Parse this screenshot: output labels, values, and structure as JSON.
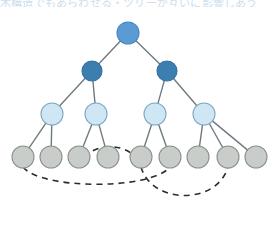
{
  "figure": {
    "background_color": "#ffffff",
    "width": 279,
    "height": 235
  },
  "caption": {
    "text": "木構造でもあらわせる・ツリーが互いに影響しあう",
    "color": "#9fc4e0",
    "clipped": true
  },
  "palette": {
    "root_fill": "#5a9bd4",
    "root_stroke": "#4a86bd",
    "level2_fill": "#3d7eb0",
    "level2_stroke": "#356f9c",
    "level3_fill": "#cfe7f5",
    "level3_stroke": "#7fa8bf",
    "leaf_fill": "#c8cdc9",
    "leaf_stroke": "#8a918d",
    "edge_color": "#6f7a80",
    "dashed_color": "#2b2b2b"
  },
  "chart_data": {
    "type": "diagram",
    "levels": [
      {
        "name": "root",
        "y": 33,
        "radius": 11,
        "count": 1
      },
      {
        "name": "level2",
        "y": 71,
        "radius": 10,
        "count": 2
      },
      {
        "name": "level3",
        "y": 114,
        "radius": 11,
        "count": 4
      },
      {
        "name": "leaf",
        "y": 157,
        "radius": 11,
        "count": 9
      }
    ],
    "nodes": [
      {
        "id": "r",
        "level": "root",
        "x": 128,
        "y": 33,
        "r": 11,
        "fill": "#5a9bd4",
        "stroke": "#4a86bd"
      },
      {
        "id": "a",
        "level": "level2",
        "x": 92,
        "y": 71,
        "r": 10,
        "fill": "#3d7eb0",
        "stroke": "#356f9c"
      },
      {
        "id": "b",
        "level": "level2",
        "x": 167,
        "y": 71,
        "r": 10,
        "fill": "#3d7eb0",
        "stroke": "#356f9c"
      },
      {
        "id": "c1",
        "level": "level3",
        "x": 52,
        "y": 114,
        "r": 11,
        "fill": "#cfe7f5",
        "stroke": "#7fa8bf"
      },
      {
        "id": "c2",
        "level": "level3",
        "x": 96,
        "y": 114,
        "r": 11,
        "fill": "#cfe7f5",
        "stroke": "#7fa8bf"
      },
      {
        "id": "c3",
        "level": "level3",
        "x": 155,
        "y": 114,
        "r": 11,
        "fill": "#cfe7f5",
        "stroke": "#7fa8bf"
      },
      {
        "id": "c4",
        "level": "level3",
        "x": 204,
        "y": 114,
        "r": 11,
        "fill": "#cfe7f5",
        "stroke": "#7fa8bf"
      },
      {
        "id": "l1",
        "level": "leaf",
        "x": 23,
        "y": 157,
        "r": 11,
        "fill": "#c8cdc9",
        "stroke": "#8a918d"
      },
      {
        "id": "l2",
        "level": "leaf",
        "x": 51,
        "y": 157,
        "r": 11,
        "fill": "#c8cdc9",
        "stroke": "#8a918d"
      },
      {
        "id": "l3",
        "level": "leaf",
        "x": 79,
        "y": 157,
        "r": 11,
        "fill": "#c8cdc9",
        "stroke": "#8a918d"
      },
      {
        "id": "l4",
        "level": "leaf",
        "x": 108,
        "y": 157,
        "r": 11,
        "fill": "#c8cdc9",
        "stroke": "#8a918d"
      },
      {
        "id": "l5",
        "level": "leaf",
        "x": 141,
        "y": 157,
        "r": 11,
        "fill": "#c8cdc9",
        "stroke": "#8a918d"
      },
      {
        "id": "l6",
        "level": "leaf",
        "x": 170,
        "y": 157,
        "r": 11,
        "fill": "#c8cdc9",
        "stroke": "#8a918d"
      },
      {
        "id": "l7",
        "level": "leaf",
        "x": 198,
        "y": 157,
        "r": 11,
        "fill": "#c8cdc9",
        "stroke": "#8a918d"
      },
      {
        "id": "l8",
        "level": "leaf",
        "x": 228,
        "y": 157,
        "r": 11,
        "fill": "#c8cdc9",
        "stroke": "#8a918d"
      },
      {
        "id": "l9",
        "level": "leaf",
        "x": 256,
        "y": 157,
        "r": 11,
        "fill": "#c8cdc9",
        "stroke": "#8a918d"
      }
    ],
    "edges": [
      {
        "from": "r",
        "to": "a"
      },
      {
        "from": "r",
        "to": "b"
      },
      {
        "from": "a",
        "to": "c1"
      },
      {
        "from": "a",
        "to": "c2"
      },
      {
        "from": "b",
        "to": "c3"
      },
      {
        "from": "b",
        "to": "c4"
      },
      {
        "from": "c1",
        "to": "l1"
      },
      {
        "from": "c1",
        "to": "l2"
      },
      {
        "from": "c2",
        "to": "l3"
      },
      {
        "from": "c2",
        "to": "l4"
      },
      {
        "from": "c3",
        "to": "l5"
      },
      {
        "from": "c3",
        "to": "l6"
      },
      {
        "from": "c4",
        "to": "l7"
      },
      {
        "from": "c4",
        "to": "l8"
      },
      {
        "from": "c4",
        "to": "l9"
      }
    ],
    "dashed_links": [
      {
        "from": "l1",
        "to": "l6",
        "sweep": 190
      },
      {
        "from": "l3",
        "to": "l5",
        "sweep": 140
      },
      {
        "from": "l5",
        "to": "l8",
        "sweep": 205
      }
    ],
    "edge_style": {
      "width": 1.4,
      "color": "#6f7a80"
    },
    "dashed_style": {
      "width": 1.6,
      "color": "#2b2b2b",
      "dash": "6 5"
    }
  }
}
